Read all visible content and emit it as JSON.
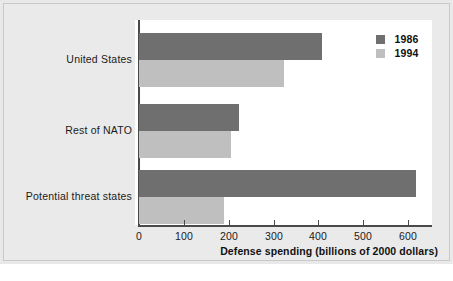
{
  "chart_data": {
    "type": "bar",
    "orientation": "horizontal",
    "title": "",
    "subtitle": "",
    "xlabel": "Defense spending (billions of 2000 dollars)",
    "ylabel": "",
    "categories": [
      "United States",
      "Rest of NATO",
      "Potential threat states"
    ],
    "series": [
      {
        "name": "1986",
        "color": "#6f6f6f",
        "values": [
          409,
          223,
          618
        ]
      },
      {
        "name": "1994",
        "color": "#bfbfbf",
        "values": [
          324,
          205,
          190
        ]
      }
    ],
    "xlim": [
      0,
      660
    ],
    "xticks": [
      0,
      100,
      200,
      300,
      400,
      500,
      600
    ],
    "xtick_labels": [
      "0",
      "100",
      "200",
      "300",
      "400",
      "500",
      "600"
    ],
    "grid": false,
    "legend_position": "top-right",
    "legend_entries": [
      "1986",
      "1994"
    ],
    "annotations": []
  },
  "colors": {
    "series_1986": "#6f6f6f",
    "series_1994": "#bfbfbf",
    "panel_background": "#eaeaea",
    "plot_background": "#ffffff",
    "axis": "#4a4a4a",
    "text": "#1a1a1a"
  }
}
